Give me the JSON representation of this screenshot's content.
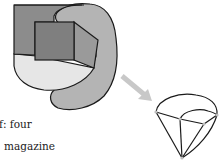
{
  "figure": {
    "colors": {
      "outline": "#1a1a1a",
      "dark_rect": "#8c8c8c",
      "ear_shape": "#b4b4b4",
      "inner_square": "#7f7f7f",
      "side_face": "#9a9a9a",
      "pale_region": "#e6e6e6",
      "arrow": "#c8c8c8",
      "vertex_dot": "#bdbdbd"
    },
    "left_shape": {
      "description": "3D cube embedded in layered rounded regions"
    },
    "arrow": {
      "direction": "down-right"
    },
    "right_shape": {
      "description": "cone-like polyhedron with curved top"
    }
  },
  "text_fragments": [
    "f: four",
    "magazine"
  ]
}
